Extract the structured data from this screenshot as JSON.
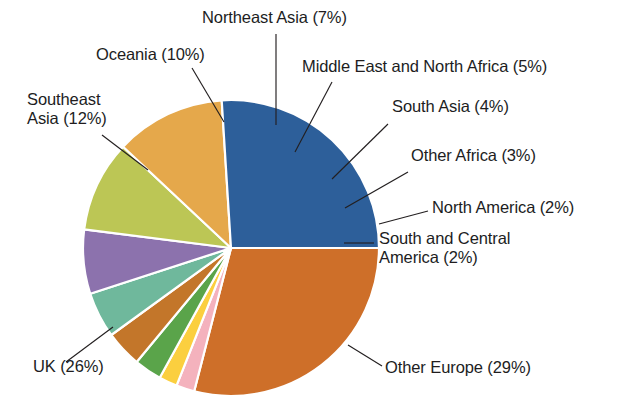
{
  "chart_data": {
    "type": "pie",
    "title": "",
    "subtitle": "",
    "xlabel": "",
    "ylabel": "",
    "legend_position": "none",
    "grid": false,
    "labels_format": "{name} ({value}%)",
    "start_angle_deg": 0,
    "direction": "clockwise",
    "categories": [
      "Other Europe",
      "South and Central America",
      "North America",
      "Other Africa",
      "South Asia",
      "Middle East and North Africa",
      "Northeast Asia",
      "Oceania",
      "Southeast Asia",
      "UK"
    ],
    "values": [
      29,
      2,
      2,
      3,
      4,
      5,
      7,
      10,
      12,
      26
    ],
    "colors": [
      "#ce6f29",
      "#f4b2bd",
      "#fbcf3f",
      "#5aa44a",
      "#c3762a",
      "#6fb89c",
      "#8c72ad",
      "#bcc655",
      "#e5a84b",
      "#2d5f9a"
    ],
    "slices": [
      {
        "name": "Other Europe",
        "value": 29,
        "label": "Other Europe (29%)",
        "color": "#ce6f29"
      },
      {
        "name": "South and Central America",
        "value": 2,
        "label": "South and Central\nAmerica (2%)",
        "color": "#f4b2bd"
      },
      {
        "name": "North America",
        "value": 2,
        "label": "North America (2%)",
        "color": "#fbcf3f"
      },
      {
        "name": "Other Africa",
        "value": 3,
        "label": "Other Africa (3%)",
        "color": "#5aa44a"
      },
      {
        "name": "South Asia",
        "value": 4,
        "label": "South Asia (4%)",
        "color": "#c3762a"
      },
      {
        "name": "Middle East and North Africa",
        "value": 5,
        "label": "Middle East and North Africa (5%)",
        "color": "#6fb89c"
      },
      {
        "name": "Northeast Asia",
        "value": 7,
        "label": "Northeast Asia (7%)",
        "color": "#8c72ad"
      },
      {
        "name": "Oceania",
        "value": 10,
        "label": "Oceania (10%)",
        "color": "#bcc655"
      },
      {
        "name": "Southeast Asia",
        "value": 12,
        "label": "Southeast\nAsia (12%)",
        "color": "#e5a84b"
      },
      {
        "name": "UK",
        "value": 26,
        "label": "UK (26%)",
        "color": "#2d5f9a"
      }
    ],
    "total": 100,
    "units": "%"
  },
  "labels": {
    "northeast_asia": "Northeast Asia (7%)",
    "oceania": "Oceania (10%)",
    "mena": "Middle East and North Africa (5%)",
    "southeast_asia": "Southeast\nAsia (12%)",
    "south_asia": "South Asia (4%)",
    "other_africa": "Other Africa (3%)",
    "north_america": "North America (2%)",
    "south_and_central_america": "South and Central\nAmerica (2%)",
    "uk": "UK (26%)",
    "other_europe": "Other Europe (29%)"
  },
  "style": {
    "background": "#ffffff",
    "slice_border": "#ffffff",
    "text_color": "#231f20",
    "leader_color": "#231f20"
  }
}
